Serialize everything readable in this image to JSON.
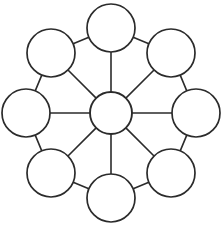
{
  "diagram": {
    "type": "node-link-wheel",
    "canvas": {
      "width": 223,
      "height": 226
    },
    "style": {
      "background_color": "#ffffff",
      "stroke_color": "#2b2b2b",
      "node_fill_color": "#ffffff",
      "node_stroke_width": 1.7,
      "edge_stroke_width": 1.6
    },
    "hub": {
      "name": "center-node",
      "label": "",
      "cx": 111,
      "cy": 113,
      "r": 21
    },
    "outer_node_radius": 24,
    "outer_ring_radius": 85,
    "outer_nodes": [
      {
        "name": "node-top",
        "label": "",
        "cx": 111,
        "cy": 28,
        "r": 24,
        "angle_deg": 270
      },
      {
        "name": "node-top-right",
        "label": "",
        "cx": 171,
        "cy": 53,
        "r": 24,
        "angle_deg": 315
      },
      {
        "name": "node-right",
        "label": "",
        "cx": 196,
        "cy": 113,
        "r": 24,
        "angle_deg": 0
      },
      {
        "name": "node-bottom-right",
        "label": "",
        "cx": 171,
        "cy": 173,
        "r": 24,
        "angle_deg": 45
      },
      {
        "name": "node-bottom",
        "label": "",
        "cx": 111,
        "cy": 198,
        "r": 24,
        "angle_deg": 90
      },
      {
        "name": "node-bottom-left",
        "label": "",
        "cx": 51,
        "cy": 173,
        "r": 24,
        "angle_deg": 135
      },
      {
        "name": "node-left",
        "label": "",
        "cx": 26,
        "cy": 113,
        "r": 24,
        "angle_deg": 180
      },
      {
        "name": "node-top-left",
        "label": "",
        "cx": 51,
        "cy": 53,
        "r": 24,
        "angle_deg": 225
      }
    ],
    "spokes": [
      {
        "name": "spoke-center-to-top",
        "from": "center-node",
        "to": "node-top"
      },
      {
        "name": "spoke-center-to-top-right",
        "from": "center-node",
        "to": "node-top-right"
      },
      {
        "name": "spoke-center-to-right",
        "from": "center-node",
        "to": "node-right"
      },
      {
        "name": "spoke-center-to-bottom-right",
        "from": "center-node",
        "to": "node-bottom-right"
      },
      {
        "name": "spoke-center-to-bottom",
        "from": "center-node",
        "to": "node-bottom"
      },
      {
        "name": "spoke-center-to-bottom-left",
        "from": "center-node",
        "to": "node-bottom-left"
      },
      {
        "name": "spoke-center-to-left",
        "from": "center-node",
        "to": "node-left"
      },
      {
        "name": "spoke-center-to-top-left",
        "from": "center-node",
        "to": "node-top-left"
      }
    ],
    "rim_edges": [
      {
        "name": "rim-top-to-top-right",
        "from": "node-top",
        "to": "node-top-right"
      },
      {
        "name": "rim-top-right-to-right",
        "from": "node-top-right",
        "to": "node-right"
      },
      {
        "name": "rim-right-to-bottom-right",
        "from": "node-right",
        "to": "node-bottom-right"
      },
      {
        "name": "rim-bottom-right-to-bottom",
        "from": "node-bottom-right",
        "to": "node-bottom"
      },
      {
        "name": "rim-bottom-to-bottom-left",
        "from": "node-bottom",
        "to": "node-bottom-left"
      },
      {
        "name": "rim-bottom-left-to-left",
        "from": "node-bottom-left",
        "to": "node-left"
      },
      {
        "name": "rim-left-to-top-left",
        "from": "node-left",
        "to": "node-top-left"
      },
      {
        "name": "rim-top-left-to-top",
        "from": "node-top-left",
        "to": "node-top"
      }
    ]
  }
}
